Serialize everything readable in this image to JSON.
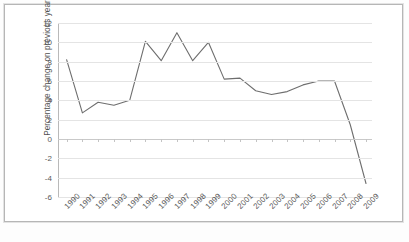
{
  "chart_data": {
    "type": "line",
    "title": "",
    "xlabel": "",
    "ylabel": "Percentage change on previous year",
    "ylim": [
      -6,
      12
    ],
    "yticks": [
      12,
      10,
      8,
      6,
      4,
      2,
      0,
      -2,
      -4,
      -6
    ],
    "ytick_labels": [
      "12",
      "10",
      "8",
      "6",
      "4",
      "2",
      "0",
      "-2",
      "-4",
      "-6"
    ],
    "grid": true,
    "legend": "none",
    "line_color": "#6e6e6e",
    "grid_color": "#e4e4e4",
    "categories": [
      "1990",
      "1991",
      "1992",
      "1993",
      "1994",
      "1995",
      "1996",
      "1997",
      "1998",
      "1999",
      "2000",
      "2001",
      "2002",
      "2003",
      "2004",
      "2005",
      "2006",
      "2007",
      "2008",
      "2009"
    ],
    "values": [
      8.2,
      2.7,
      3.8,
      3.5,
      4.0,
      10.1,
      8.1,
      11.0,
      8.1,
      10.0,
      6.2,
      6.3,
      5.0,
      4.6,
      4.9,
      5.6,
      6.0,
      6.0,
      1.5,
      -4.6
    ],
    "series": [
      {
        "name": "Percentage change on previous year",
        "values": [
          8.2,
          2.7,
          3.8,
          3.5,
          4.0,
          10.1,
          8.1,
          11.0,
          8.1,
          10.0,
          6.2,
          6.3,
          5.0,
          4.6,
          4.9,
          5.6,
          6.0,
          6.0,
          1.5,
          -4.6
        ]
      }
    ]
  },
  "caption": ""
}
